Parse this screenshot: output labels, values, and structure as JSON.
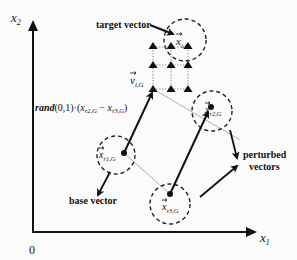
{
  "axes": {
    "x_label": "x",
    "x_sub": "1",
    "y_label": "x",
    "y_sub": "2",
    "origin": "0"
  },
  "labels": {
    "target_vector": "target vector",
    "base_vector": "base vector",
    "perturbed_line1": "perturbed",
    "perturbed_line2": "vectors",
    "v_main": "v",
    "v_sub": "i,G",
    "xi_main": "x",
    "xi_sub": "i,G",
    "xr1_main": "x",
    "xr1_sub": "r1,G",
    "xr2_main": "x",
    "xr2_sub": "r2,G",
    "xr3_main": "x",
    "xr3_sub": "r3,G",
    "rand_prefix": "rand",
    "rand_rest": "(0,1)·(",
    "rand_x1": "x",
    "rand_x1_sub": "r2,G",
    "rand_minus": " − ",
    "rand_x2": "x",
    "rand_x2_sub": "r3,G",
    "rand_close": ")"
  },
  "colors": {
    "ink": "#111111",
    "faint_line": "#9a9a9a",
    "background": "#fbfbfb"
  }
}
